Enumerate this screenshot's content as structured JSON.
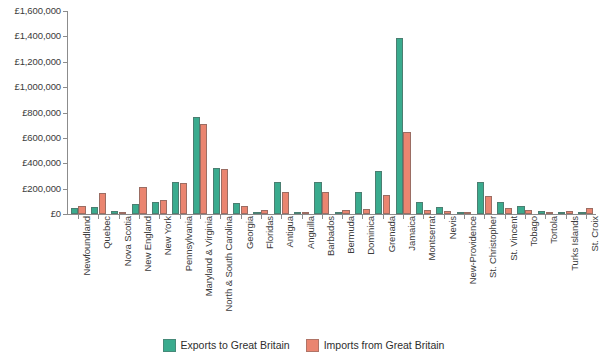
{
  "chart_data": {
    "type": "bar",
    "title": "",
    "xlabel": "",
    "ylabel": "",
    "ylim": [
      0,
      1600000
    ],
    "ytick_labels": [
      "£0",
      "£200,000",
      "£400,000",
      "£600,000",
      "£800,000",
      "£1,000,000",
      "£1,200,000",
      "£1,400,000",
      "£1,600,000"
    ],
    "ytick_values": [
      0,
      200000,
      400000,
      600000,
      800000,
      1000000,
      1200000,
      1400000,
      1600000
    ],
    "grid": false,
    "legend_position": "bottom-center",
    "colors": {
      "exports": "#3aab8e",
      "imports": "#ea8570",
      "axis": "#8c8c8c",
      "text": "#3a3a3a",
      "background": "#ffffff"
    },
    "categories": [
      "Newfoundland",
      "Quebec",
      "Nova Scotia",
      "New England",
      "New York",
      "Pennsylvania",
      "Maryland & Virginia",
      "North & South Carolina",
      "Georgia",
      "Floridas",
      "Antigua",
      "Anguilla",
      "Barbados",
      "Bermuda",
      "Dominica",
      "Grenada",
      "Jamaica",
      "Montserrat",
      "Nevis",
      "New-Providence",
      "St. Christopher",
      "St. Vincent",
      "Tobago",
      "Tortola",
      "Turks Islands",
      "St. Croix"
    ],
    "series": [
      {
        "name": "Exports to Great Britain",
        "color": "#3aab8e",
        "values": [
          45000,
          55000,
          20000,
          75000,
          95000,
          255000,
          765000,
          365000,
          85000,
          12000,
          255000,
          8000,
          255000,
          10000,
          175000,
          340000,
          1390000,
          95000,
          55000,
          10000,
          255000,
          95000,
          65000,
          25000,
          8000,
          6000
        ]
      },
      {
        "name": "Imports from Great Britain",
        "color": "#ea8570",
        "values": [
          65000,
          165000,
          18000,
          215000,
          110000,
          245000,
          710000,
          355000,
          60000,
          30000,
          175000,
          6000,
          175000,
          35000,
          40000,
          150000,
          650000,
          30000,
          25000,
          12000,
          145000,
          50000,
          35000,
          18000,
          20000,
          45000
        ]
      }
    ]
  },
  "legend": {
    "items": [
      {
        "label": "Exports to Great Britain",
        "key": "exports"
      },
      {
        "label": "Imports from Great Britain",
        "key": "imports"
      }
    ]
  }
}
